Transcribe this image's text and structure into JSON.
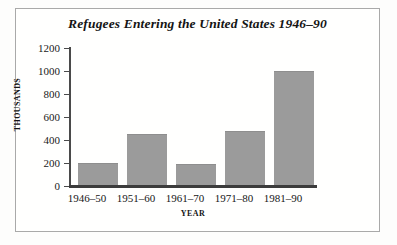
{
  "chart_data": {
    "type": "bar",
    "title": "Refugees Entering the United States 1946–90",
    "xlabel": "YEAR",
    "ylabel": "THOUSANDS",
    "categories": [
      "1946–50",
      "1951–60",
      "1961–70",
      "1971–80",
      "1981–90"
    ],
    "values": [
      200,
      450,
      190,
      475,
      1000
    ],
    "ylim": [
      0,
      1200
    ],
    "yticks": [
      0,
      200,
      400,
      600,
      800,
      1000,
      1200
    ],
    "ytick_labels": [
      "0",
      "200",
      "400",
      "600",
      "800",
      "1000",
      "1200"
    ],
    "grid": false,
    "legend": null,
    "bar_color": "#9b9b9b",
    "axis_color": "#3c3c3c",
    "text_color": "#151515",
    "border_color": "#a9a9a9"
  }
}
